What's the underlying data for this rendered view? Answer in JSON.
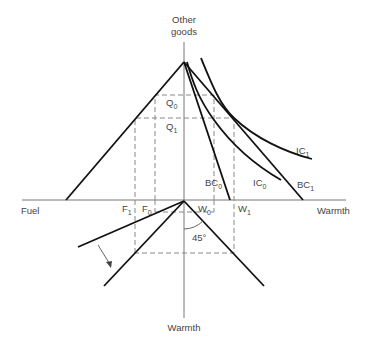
{
  "axes": {
    "y_top_label_line1": "Other",
    "y_top_label_line2": "goods",
    "x_left_label": "Fuel",
    "x_right_label": "Warmth",
    "y_bottom_label": "Warmth"
  },
  "labels": {
    "Q0": {
      "base": "Q",
      "sub": "0"
    },
    "Q1": {
      "base": "Q",
      "sub": "1"
    },
    "F0": {
      "base": "F",
      "sub": "0"
    },
    "F1": {
      "base": "F",
      "sub": "1"
    },
    "W0": {
      "base": "W",
      "sub": "0"
    },
    "W1": {
      "base": "W",
      "sub": "1"
    },
    "BC0": {
      "base": "BC",
      "sub": "0"
    },
    "BC1": {
      "base": "BC",
      "sub": "1"
    },
    "IC0": {
      "base": "IC",
      "sub": "0"
    },
    "IC1": {
      "base": "IC",
      "sub": "1"
    },
    "angle": "45°"
  }
}
